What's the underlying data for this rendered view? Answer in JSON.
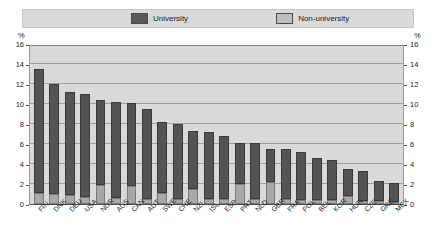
{
  "legend": {
    "items": [
      {
        "label": "University",
        "color": "#545454",
        "icon": "legend-swatch-university"
      },
      {
        "label": "Non-university",
        "color": "#a8a8a8",
        "icon": "legend-swatch-non-university"
      }
    ]
  },
  "axis": {
    "unit_left": "%",
    "unit_right": "%",
    "yticks": [
      "0",
      "2",
      "4",
      "6",
      "8",
      "10",
      "12",
      "14",
      "16"
    ]
  },
  "chart_data": {
    "type": "bar",
    "subtype": "stacked-vertical",
    "title": "",
    "xlabel": "",
    "ylabel": "%",
    "ylim": [
      0,
      16
    ],
    "ytick_step": 2,
    "grid": true,
    "legend_position": "top",
    "categories": [
      "FIN",
      "DNK",
      "DEU",
      "USA",
      "NOR",
      "AUS",
      "CAN",
      "AUT",
      "SWE",
      "CHE",
      "NZL",
      "ISL",
      "ESP",
      "PRT",
      "NLD",
      "GBR",
      "FRA",
      "POL",
      "BEL",
      "KOR",
      "HUN",
      "CZE",
      "GRC",
      "MEX"
    ],
    "series": [
      {
        "name": "Non-university",
        "color": "#a8a8a8",
        "values": [
          1.1,
          1.0,
          0.9,
          0.7,
          1.9,
          0.6,
          1.8,
          0.5,
          1.1,
          0.5,
          1.5,
          0.5,
          0.5,
          2.0,
          0.5,
          2.2,
          0.5,
          0.4,
          0.4,
          0.4,
          0.8,
          0.3,
          0.3,
          0.2
        ]
      },
      {
        "name": "University",
        "color": "#545454",
        "values": [
          12.4,
          11.0,
          10.3,
          10.3,
          8.5,
          9.6,
          8.3,
          9.0,
          7.1,
          7.5,
          5.8,
          6.7,
          6.3,
          4.1,
          5.6,
          3.3,
          5.0,
          4.8,
          4.2,
          4.0,
          2.7,
          3.0,
          2.0,
          1.9
        ]
      }
    ],
    "totals": [
      13.5,
      12.0,
      11.2,
      11.0,
      10.4,
      10.2,
      10.1,
      9.5,
      8.2,
      8.0,
      7.3,
      7.2,
      6.8,
      6.1,
      6.1,
      5.5,
      5.5,
      5.2,
      4.6,
      4.4,
      3.5,
      3.3,
      2.3,
      2.1
    ]
  }
}
